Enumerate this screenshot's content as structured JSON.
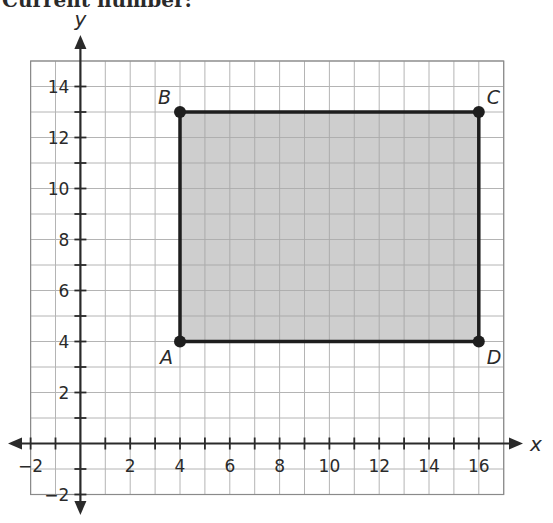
{
  "header": {
    "text": "Current number:"
  },
  "chart_data": {
    "type": "scatter",
    "title": "",
    "xlabel": "x",
    "ylabel": "y",
    "xlim": [
      -2,
      17
    ],
    "ylim": [
      -2,
      15
    ],
    "grid": true,
    "x_ticks": [
      -2,
      2,
      4,
      6,
      8,
      10,
      12,
      14,
      16
    ],
    "y_ticks": [
      -2,
      2,
      4,
      6,
      8,
      10,
      12,
      14
    ],
    "points": [
      {
        "label": "A",
        "x": 4,
        "y": 4
      },
      {
        "label": "B",
        "x": 4,
        "y": 13
      },
      {
        "label": "C",
        "x": 16,
        "y": 13
      },
      {
        "label": "D",
        "x": 16,
        "y": 4
      }
    ],
    "polygon": {
      "vertices": [
        "A",
        "B",
        "C",
        "D"
      ],
      "fill": "#c6c6c6",
      "stroke": "#1e1e1e"
    },
    "colors": {
      "grid": "#b4b4b4",
      "axis": "#2a2a2a",
      "fill": "#c6c6c6",
      "outline": "#1e1e1e"
    }
  }
}
